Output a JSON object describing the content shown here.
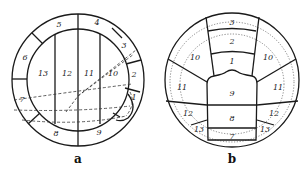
{
  "figure": {
    "panel_a": {
      "caption": "a",
      "outer_segments": [
        "1",
        "2",
        "3",
        "4",
        "5",
        "6",
        "7",
        "8",
        "9"
      ],
      "inner_segments": [
        "10",
        "11",
        "12",
        "13"
      ],
      "labels": {
        "s1": "1",
        "s2": "2",
        "s3": "3",
        "s4": "4",
        "s5": "5",
        "s6": "6",
        "s7": "7",
        "s8": "8",
        "s9": "9",
        "s10": "10",
        "s11": "11",
        "s12": "12",
        "s13": "13"
      }
    },
    "panel_b": {
      "caption": "b",
      "labels": {
        "s1": "1",
        "s2": "2",
        "s3": "3",
        "s7": "7",
        "s8": "8",
        "s9": "9",
        "s10_left": "10",
        "s10_right": "10",
        "s11_left": "11",
        "s11_right": "11",
        "s12_left": "12",
        "s12_right": "12",
        "s13_left": "13",
        "s13_right": "13"
      }
    }
  }
}
